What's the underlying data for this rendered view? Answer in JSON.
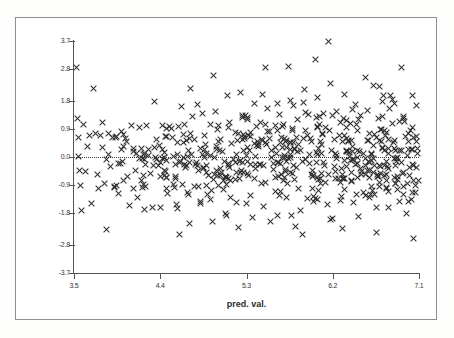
{
  "figure": {
    "type": "scatter-plot",
    "x_axis_title": "pred. val.",
    "y_axis_title": "std( const)",
    "marker_icon": "x-marker-icon",
    "zero_reference_line": "dotted"
  },
  "chart_data": {
    "type": "scatter",
    "title": "",
    "xlabel": "pred. val.",
    "ylabel": "std( const)",
    "xlim": [
      3.5,
      7.1
    ],
    "ylim": [
      -3.7,
      3.7
    ],
    "xticks": [
      "3.5",
      "4.4",
      "5.3",
      "6.2",
      "7.1"
    ],
    "xtick_values": [
      3.5,
      4.4,
      5.3,
      6.2,
      7.1
    ],
    "yticks": [
      "3.7",
      "2.8",
      "1.8",
      "0.9",
      "0.0",
      "-0.9",
      "-1.8",
      "-2.8",
      "-3.7"
    ],
    "ytick_values": [
      3.7,
      2.8,
      1.8,
      0.9,
      0.0,
      -0.9,
      -1.8,
      -2.8,
      -3.7
    ],
    "grid": false,
    "legend": null,
    "marker": "x",
    "marker_color": "#2f2f2f",
    "annotations": [
      {
        "kind": "hline",
        "y": 0.0,
        "style": "dotted",
        "label": "0.0"
      }
    ],
    "series": [
      {
        "name": "residuals",
        "points": [
          [
            3.53,
            2.85
          ],
          [
            3.54,
            1.22
          ],
          [
            3.55,
            0.62
          ],
          [
            3.55,
            0.02
          ],
          [
            3.56,
            -0.44
          ],
          [
            3.57,
            -0.92
          ],
          [
            3.58,
            -1.72
          ],
          [
            3.6,
            1.05
          ],
          [
            3.62,
            -0.47
          ],
          [
            3.64,
            0.35
          ],
          [
            3.66,
            0.7
          ],
          [
            3.68,
            -1.48
          ],
          [
            3.7,
            2.2
          ],
          [
            3.72,
            0.75
          ],
          [
            3.74,
            -0.56
          ],
          [
            3.76,
            -1.02
          ],
          [
            3.78,
            0.68
          ],
          [
            3.8,
            0.3
          ],
          [
            3.82,
            -0.86
          ],
          [
            3.84,
            -2.3
          ],
          [
            3.86,
            0.74
          ],
          [
            3.88,
            -0.3
          ],
          [
            3.9,
            0.62
          ],
          [
            3.92,
            -0.98
          ],
          [
            3.94,
            0.66
          ],
          [
            3.96,
            -1.18
          ],
          [
            3.98,
            -0.2
          ],
          [
            4.0,
            0.82
          ],
          [
            4.02,
            -0.74
          ],
          [
            4.04,
            0.6
          ],
          [
            4.06,
            -0.62
          ],
          [
            4.08,
            -1.56
          ],
          [
            4.1,
            1.02
          ],
          [
            4.12,
            0.18
          ],
          [
            4.14,
            -0.42
          ],
          [
            4.16,
            -1.3
          ],
          [
            4.18,
            0.94
          ],
          [
            4.2,
            0.28
          ],
          [
            4.22,
            -0.88
          ],
          [
            4.24,
            -1.66
          ],
          [
            4.26,
            1.0
          ],
          [
            4.28,
            0.06
          ],
          [
            4.3,
            -0.52
          ],
          [
            4.32,
            -1.62
          ],
          [
            4.34,
            1.78
          ],
          [
            4.36,
            0.56
          ],
          [
            4.38,
            -0.26
          ],
          [
            4.4,
            -1.6
          ],
          [
            4.42,
            1.02
          ],
          [
            4.44,
            0.14
          ],
          [
            4.46,
            -0.64
          ],
          [
            4.48,
            -1.18
          ],
          [
            4.5,
            0.98
          ],
          [
            4.52,
            0.9
          ],
          [
            4.54,
            0.02
          ],
          [
            4.56,
            -0.7
          ],
          [
            4.58,
            -1.64
          ],
          [
            4.6,
            -2.48
          ],
          [
            4.62,
            1.6
          ],
          [
            4.64,
            0.46
          ],
          [
            4.66,
            -0.34
          ],
          [
            4.68,
            -1.12
          ],
          [
            4.7,
            -2.12
          ],
          [
            4.72,
            2.2
          ],
          [
            4.74,
            1.3
          ],
          [
            4.76,
            0.55
          ],
          [
            4.78,
            -0.16
          ],
          [
            4.8,
            -0.95
          ],
          [
            4.82,
            -1.48
          ],
          [
            4.84,
            1.4
          ],
          [
            4.86,
            0.7
          ],
          [
            4.88,
            0.1
          ],
          [
            4.9,
            -0.6
          ],
          [
            4.92,
            -1.35
          ],
          [
            4.94,
            -2.05
          ],
          [
            4.96,
            2.6
          ],
          [
            4.98,
            1.45
          ],
          [
            5.0,
            0.88
          ],
          [
            5.02,
            0.2
          ],
          [
            5.04,
            -0.48
          ],
          [
            5.06,
            -1.05
          ],
          [
            5.08,
            -1.8
          ],
          [
            5.1,
            1.95
          ],
          [
            5.12,
            1.1
          ],
          [
            5.14,
            0.44
          ],
          [
            5.16,
            -0.08
          ],
          [
            5.18,
            -0.72
          ],
          [
            5.2,
            -1.44
          ],
          [
            5.22,
            -2.25
          ],
          [
            5.24,
            2.05
          ],
          [
            5.26,
            1.25
          ],
          [
            5.28,
            0.66
          ],
          [
            5.3,
            0.04
          ],
          [
            5.32,
            -0.58
          ],
          [
            5.34,
            -1.22
          ],
          [
            5.36,
            -1.92
          ],
          [
            5.38,
            1.7
          ],
          [
            5.4,
            0.98
          ],
          [
            5.42,
            0.32
          ],
          [
            5.44,
            -0.24
          ],
          [
            5.46,
            -0.86
          ],
          [
            5.48,
            -1.58
          ],
          [
            5.5,
            2.85
          ],
          [
            5.52,
            1.55
          ],
          [
            5.54,
            0.8
          ],
          [
            5.56,
            0.22
          ],
          [
            5.58,
            -0.4
          ],
          [
            5.6,
            -1.1
          ],
          [
            5.62,
            -1.85
          ],
          [
            5.64,
            1.35
          ],
          [
            5.66,
            0.62
          ],
          [
            5.68,
            0.0
          ],
          [
            5.7,
            -0.66
          ],
          [
            5.72,
            -1.3
          ],
          [
            5.74,
            2.9
          ],
          [
            5.76,
            1.8
          ],
          [
            5.78,
            0.92
          ],
          [
            5.8,
            0.26
          ],
          [
            5.82,
            -0.34
          ],
          [
            5.84,
            -1.02
          ],
          [
            5.86,
            -1.7
          ],
          [
            5.88,
            -2.46
          ],
          [
            5.9,
            2.15
          ],
          [
            5.92,
            1.42
          ],
          [
            5.94,
            0.7
          ],
          [
            5.96,
            0.08
          ],
          [
            5.98,
            -0.56
          ],
          [
            6.0,
            -1.26
          ],
          [
            6.02,
            3.1
          ],
          [
            6.04,
            1.9
          ],
          [
            6.06,
            1.05
          ],
          [
            6.08,
            0.4
          ],
          [
            6.1,
            -0.18
          ],
          [
            6.12,
            -0.8
          ],
          [
            6.14,
            -1.5
          ],
          [
            6.16,
            3.7
          ],
          [
            6.18,
            2.35
          ],
          [
            6.2,
            1.32
          ],
          [
            6.22,
            0.56
          ],
          [
            6.24,
            -0.04
          ],
          [
            6.26,
            -0.68
          ],
          [
            6.28,
            -1.38
          ],
          [
            6.3,
            -2.28
          ],
          [
            6.32,
            2.0
          ],
          [
            6.34,
            1.15
          ],
          [
            6.36,
            0.48
          ],
          [
            6.38,
            -0.12
          ],
          [
            6.4,
            -0.76
          ],
          [
            6.42,
            -1.46
          ],
          [
            6.44,
            1.68
          ],
          [
            6.46,
            0.86
          ],
          [
            6.48,
            0.16
          ],
          [
            6.5,
            -0.46
          ],
          [
            6.52,
            -1.14
          ],
          [
            6.54,
            2.55
          ],
          [
            6.56,
            1.48
          ],
          [
            6.58,
            0.74
          ],
          [
            6.6,
            0.12
          ],
          [
            6.62,
            -0.5
          ],
          [
            6.64,
            -1.2
          ],
          [
            6.66,
            -2.4
          ],
          [
            6.68,
            1.22
          ],
          [
            6.7,
            0.88
          ],
          [
            6.72,
            0.3
          ],
          [
            6.74,
            -0.28
          ],
          [
            6.76,
            -0.96
          ],
          [
            6.78,
            -1.62
          ],
          [
            6.8,
            1.96
          ],
          [
            6.82,
            1.08
          ],
          [
            6.84,
            0.52
          ],
          [
            6.86,
            -0.06
          ],
          [
            6.88,
            -0.72
          ],
          [
            6.9,
            -1.42
          ],
          [
            6.92,
            2.85
          ],
          [
            6.94,
            1.28
          ],
          [
            6.96,
            0.64
          ],
          [
            6.98,
            0.06
          ],
          [
            7.0,
            -0.6
          ],
          [
            7.02,
            -1.34
          ],
          [
            7.04,
            -2.6
          ]
        ]
      }
    ],
    "point_count_estimate": 600
  }
}
